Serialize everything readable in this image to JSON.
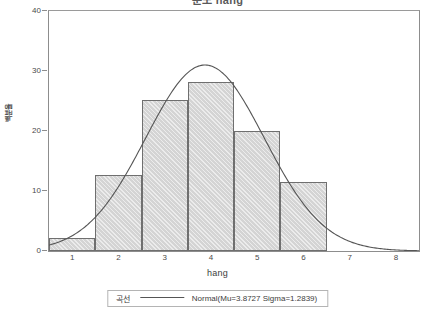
{
  "chart_data": {
    "type": "bar",
    "title": "분포 hang",
    "xlabel": "hang",
    "ylabel": "백분율",
    "categories": [
      "1",
      "2",
      "3",
      "4",
      "5",
      "6"
    ],
    "bin_centers": [
      1,
      2,
      3,
      4,
      5,
      6
    ],
    "bin_edges": [
      0.5,
      1.5,
      2.5,
      3.5,
      4.5,
      5.5,
      6.5
    ],
    "values": [
      2.2,
      12.7,
      25.1,
      28.2,
      20.0,
      11.5
    ],
    "xlim": [
      0.5,
      8.5
    ],
    "ylim": [
      0,
      40
    ],
    "xticks": [
      1,
      2,
      3,
      4,
      5,
      6,
      7,
      8
    ],
    "yticks": [
      0,
      10,
      20,
      30,
      40
    ],
    "grid": false,
    "legend_position": "bottom",
    "series": [
      {
        "name": "Normal(Mu=3.8727 Sigma=1.2839)",
        "type": "line",
        "distribution": "normal",
        "mu": 3.8727,
        "sigma": 1.2839,
        "peak_value": 31.0
      }
    ]
  },
  "title": {
    "text": "분포 hang"
  },
  "axes": {
    "y_label": "백분율",
    "x_label": "hang",
    "y_ticks": [
      {
        "label": "40",
        "value": 40
      },
      {
        "label": "30",
        "value": 30
      },
      {
        "label": "20",
        "value": 20
      },
      {
        "label": "10",
        "value": 10
      },
      {
        "label": "0",
        "value": 0
      }
    ],
    "x_ticks": [
      {
        "label": "1",
        "value": 1
      },
      {
        "label": "2",
        "value": 2
      },
      {
        "label": "3",
        "value": 3
      },
      {
        "label": "4",
        "value": 4
      },
      {
        "label": "5",
        "value": 5
      },
      {
        "label": "6",
        "value": 6
      },
      {
        "label": "7",
        "value": 7
      },
      {
        "label": "8",
        "value": 8
      }
    ]
  },
  "legend": {
    "label": "곡선",
    "entry": "Normal(Mu=3.8727 Sigma=1.2839)"
  },
  "colors": {
    "bar_fill": "#d4d4d4",
    "bar_border": "#6f6f6f",
    "curve": "#555555",
    "axis": "#8d8d8d",
    "text": "#3d3d3d",
    "background": "#ffffff"
  }
}
